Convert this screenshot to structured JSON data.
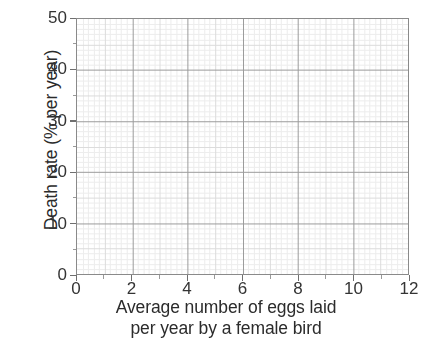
{
  "chart_data": {
    "type": "scatter",
    "title": "",
    "subtitle": "",
    "xlabel": "Average number of eggs laid per year by a female bird",
    "xlabel_lines": [
      "Average number of eggs laid",
      "per year by a female bird"
    ],
    "ylabel": "Death rate (% per year)",
    "xlim": [
      0,
      12
    ],
    "ylim": [
      0,
      50
    ],
    "x_ticks": [
      0,
      2,
      4,
      6,
      8,
      10,
      12
    ],
    "x_tick_labels": [
      "0",
      "2",
      "4",
      "6",
      "8",
      "10",
      "12"
    ],
    "y_ticks": [
      0,
      10,
      20,
      30,
      40,
      50
    ],
    "y_tick_labels": [
      "0",
      "10",
      "20",
      "30",
      "40",
      "50"
    ],
    "x_major_step": 2,
    "y_major_step": 10,
    "x_medium_step": 1,
    "y_medium_step": 5,
    "x_minor_step": 0.2,
    "y_minor_step": 1,
    "grid": true,
    "grid_style": "graph-paper",
    "legend": false,
    "legend_position": "none",
    "series": [],
    "values": [],
    "x": [],
    "annotations": [],
    "note": "Empty graph-paper axes with no plotted data points"
  },
  "colors": {
    "background": "#ffffff",
    "plot_background": "#ffffff",
    "axis_border": "#8a8a8a",
    "grid_minor": "#ededed",
    "grid_medium": "#dcdcdc",
    "grid_major": "#9c9c9c",
    "tick_mark": "#6f6f6f",
    "label_text": "#2b2b2b",
    "tick_text": "#343434"
  },
  "geometry": {
    "plot_left": 76,
    "plot_top": 18,
    "plot_width": 333,
    "plot_height": 257
  }
}
